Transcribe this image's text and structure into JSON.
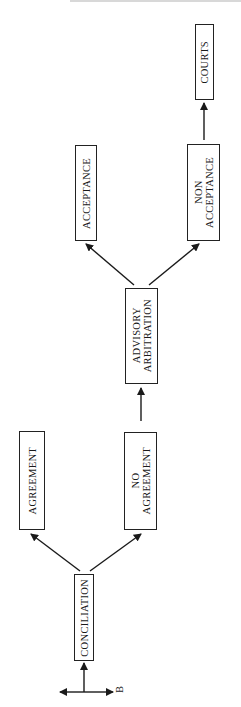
{
  "diagram": {
    "orientation": "rotated-90-ccw",
    "nodes": [
      {
        "id": "conciliation",
        "label": "CONCILIATION"
      },
      {
        "id": "agreement",
        "label": "AGREEMENT"
      },
      {
        "id": "no_agreement",
        "label": "NO\nAGREEMENT"
      },
      {
        "id": "advisory_arbitration",
        "label": "ADVISORY\nARBITRATION"
      },
      {
        "id": "acceptance",
        "label": "ACCEPTANCE"
      },
      {
        "id": "non_acceptance",
        "label": "NON\nACCEPTANCE"
      },
      {
        "id": "courts",
        "label": "COURTS"
      }
    ],
    "edges": [
      {
        "from": "conciliation",
        "to": "agreement"
      },
      {
        "from": "conciliation",
        "to": "no_agreement"
      },
      {
        "from": "no_agreement",
        "to": "advisory_arbitration"
      },
      {
        "from": "advisory_arbitration",
        "to": "acceptance"
      },
      {
        "from": "advisory_arbitration",
        "to": "non_acceptance"
      },
      {
        "from": "non_acceptance",
        "to": "courts"
      }
    ],
    "entry_marker": {
      "label": "B"
    }
  }
}
